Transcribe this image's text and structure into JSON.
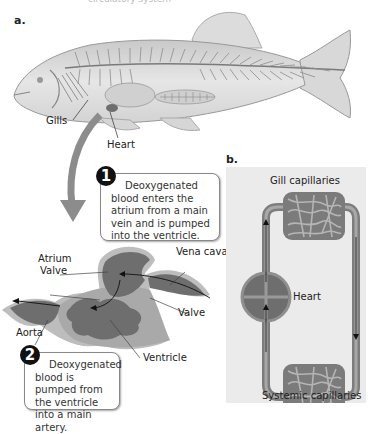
{
  "header": {
    "cutoff_text": "circulatory system"
  },
  "panel_a": {
    "label": "a.",
    "fish_labels": {
      "gills": "Gills",
      "heart": "Heart"
    },
    "heart_labels": {
      "atrium": "Atrium",
      "valve_upper": "Valve",
      "vena_cava": "Vena cava",
      "valve_lower": "Valve",
      "aorta": "Aorta",
      "ventricle": "Ventricle"
    },
    "callouts": [
      {
        "number": "1",
        "text": "Deoxygenated blood enters the atrium from a main vein and is pumped into the ventricle."
      },
      {
        "number": "2",
        "text": "Deoxygenated blood is pumped from the ventricle into a main artery."
      }
    ]
  },
  "panel_b": {
    "label": "b.",
    "labels": {
      "gill_capillaries": "Gill capillaries",
      "heart": "Heart",
      "systemic_capillaries": "Systemic capillaries"
    }
  },
  "colors": {
    "heart_dark": "#6e6e6e",
    "heart_light": "#a9a9a9",
    "panel_bg": "#ebebeb",
    "vessel": "#808080"
  }
}
